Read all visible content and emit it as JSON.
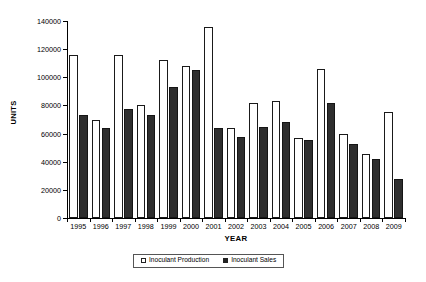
{
  "chart_data": {
    "type": "bar",
    "title": "",
    "xlabel": "YEAR",
    "ylabel": "UNITS",
    "ylim": [
      0,
      140000
    ],
    "ytick_step": 20000,
    "yticks": [
      "0",
      "20000",
      "40000",
      "60000",
      "80000",
      "100000",
      "120000",
      "140000"
    ],
    "grid": false,
    "legend_position": "bottom",
    "categories": [
      "1995",
      "1996",
      "1997",
      "1998",
      "1999",
      "2000",
      "2001",
      "2002",
      "2003",
      "2004",
      "2005",
      "2006",
      "2007",
      "2008",
      "2009"
    ],
    "series": [
      {
        "name": "Inoculant Production",
        "marker": "open-square",
        "color": "#ffffff",
        "edge_color": "#1a1a1a",
        "values": [
          116000,
          70000,
          116000,
          80000,
          112000,
          108000,
          135500,
          64000,
          82000,
          83000,
          57000,
          106000,
          60000,
          45500,
          75000
        ]
      },
      {
        "name": "Inoculant Sales",
        "marker": "filled-square",
        "color": "#2e2e2e",
        "edge_color": "#151515",
        "values": [
          73000,
          64000,
          77500,
          73000,
          93000,
          105000,
          64000,
          57500,
          64500,
          68500,
          55500,
          81500,
          52500,
          42000,
          28000
        ]
      }
    ]
  },
  "axes": {
    "y_title": "UNITS",
    "x_title": "YEAR"
  },
  "legend": {
    "items": [
      {
        "label": "Inoculant Production",
        "swatch": "open-square"
      },
      {
        "label": "Inoculant Sales",
        "swatch": "filled-square"
      }
    ]
  }
}
